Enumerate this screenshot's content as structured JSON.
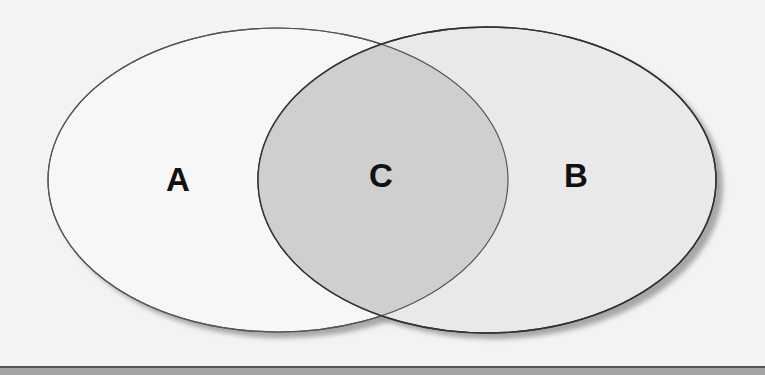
{
  "diagram": {
    "type": "venn",
    "sets": [
      {
        "id": "A",
        "label": "A",
        "fill": "#f7f7f7",
        "stroke": "#555555"
      },
      {
        "id": "B",
        "label": "B",
        "fill": "#e9e9e9",
        "stroke": "#333333"
      }
    ],
    "intersection": {
      "id": "C",
      "label": "C",
      "fill": "#cfcfcf"
    },
    "colors": {
      "background": "#f3f3f3",
      "shadow": "#9a9a9a",
      "bottom_band": "#a3a3a3",
      "bottom_line": "#555555"
    }
  }
}
